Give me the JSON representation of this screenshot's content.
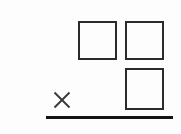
{
  "canvas": {
    "width": 181,
    "height": 134,
    "background_color": "#fdfdfd",
    "description": "Hand-drawn style line diagram: three open squares, a small X mark, and a thick horizontal baseline rule"
  },
  "ink": {
    "stroke_color": "#2b2b2b",
    "line_color": "#141414",
    "x_mark_color": "#3a3a3a"
  },
  "shapes": [
    {
      "id": "square-top-left",
      "type": "square",
      "label": "",
      "x": 78,
      "y": 21,
      "width": 39,
      "height": 39,
      "stroke_width": 2,
      "fill": "none"
    },
    {
      "id": "square-top-right",
      "type": "square",
      "label": "",
      "x": 125,
      "y": 21,
      "width": 39,
      "height": 39,
      "stroke_width": 2,
      "fill": "none"
    },
    {
      "id": "square-bottom-right",
      "type": "square",
      "label": "",
      "x": 125,
      "y": 68,
      "width": 39,
      "height": 42,
      "stroke_width": 2,
      "fill": "none"
    }
  ],
  "marks": [
    {
      "id": "x-mark",
      "type": "x",
      "glyph": "✕",
      "x": 53,
      "y": 91,
      "width": 18,
      "height": 18,
      "stroke_width": 2
    }
  ],
  "rules": [
    {
      "id": "baseline-rule",
      "type": "horizontal-line",
      "x": 46,
      "y": 116,
      "width": 127,
      "thickness": 3
    }
  ]
}
